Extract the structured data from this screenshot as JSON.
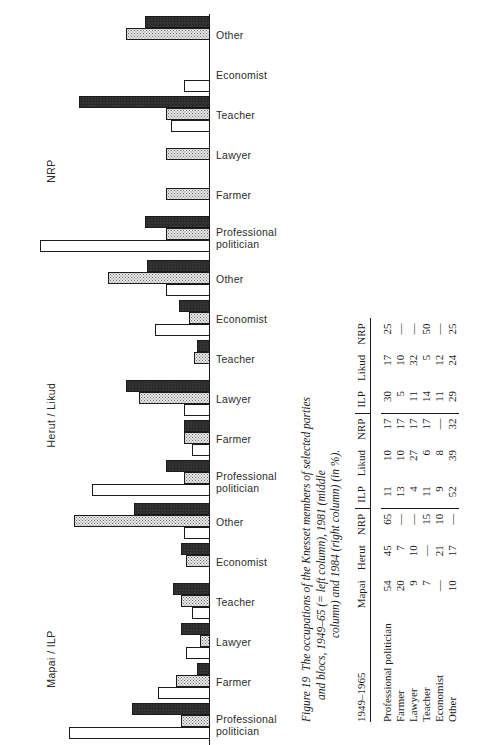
{
  "figure": {
    "number": "Figure 19",
    "caption_line1": "The occupations of the Knesset members of selected parties",
    "caption_line2": "and blocs, 1949–65 (= left column), 1981 (middle",
    "caption_line3": "column) and 1984 (right column) (in %)."
  },
  "chart_data": {
    "type": "bar",
    "orientation": "horizontal-left",
    "title": "The occupations of the Knesset members of selected parties and blocs, 1949–65 (= left column), 1981 (middle column) and 1984 (right column) (in %).",
    "xlabel": "",
    "ylabel": "",
    "xlim": [
      0,
      70
    ],
    "grid": false,
    "legend": [
      "1949–65",
      "1981",
      "1984"
    ],
    "legend_position": "none",
    "categories": [
      "Professional politician",
      "Farmer",
      "Lawyer",
      "Teacher",
      "Economist",
      "Other"
    ],
    "panels": [
      {
        "name": "NRP",
        "label": "NRP",
        "series": [
          {
            "name": "1949–65",
            "style": "white",
            "values": [
              65,
              null,
              null,
              15,
              10,
              null
            ]
          },
          {
            "name": "1981",
            "style": "dot",
            "values": [
              17,
              17,
              17,
              17,
              null,
              32
            ]
          },
          {
            "name": "1984",
            "style": "dark",
            "values": [
              25,
              null,
              null,
              50,
              null,
              25
            ]
          }
        ]
      },
      {
        "name": "Herut / Likud",
        "label": "Herut / Likud",
        "series": [
          {
            "name": "1949–65",
            "style": "white",
            "values": [
              45,
              7,
              10,
              null,
              21,
              17
            ]
          },
          {
            "name": "1981",
            "style": "dot",
            "values": [
              10,
              10,
              27,
              6,
              8,
              39
            ]
          },
          {
            "name": "1984",
            "style": "dark",
            "values": [
              17,
              10,
              32,
              5,
              12,
              24
            ]
          }
        ]
      },
      {
        "name": "Mapai / ILP",
        "label": "Mapai / ILP",
        "series": [
          {
            "name": "1949–65",
            "style": "white",
            "values": [
              54,
              20,
              9,
              7,
              null,
              10
            ]
          },
          {
            "name": "1981",
            "style": "dot",
            "values": [
              11,
              13,
              4,
              11,
              9,
              52
            ]
          },
          {
            "name": "1984",
            "style": "dark",
            "values": [
              30,
              5,
              11,
              14,
              11,
              29
            ]
          }
        ]
      }
    ]
  },
  "table": {
    "group_headers": [
      "",
      "1981",
      "1984"
    ],
    "col_headers": [
      "1949–1965",
      "Mapai",
      "Herut",
      "NRP",
      "ILP",
      "Likud",
      "NRP",
      "ILP",
      "Likud",
      "NRP"
    ],
    "rows": [
      {
        "label": "Professional",
        "label2": "politician",
        "values": [
          "54",
          "45",
          "65",
          "11",
          "10",
          "17",
          "30",
          "17",
          "25"
        ]
      },
      {
        "label": "Farmer",
        "label2": "",
        "values": [
          "20",
          "7",
          "—",
          "13",
          "10",
          "17",
          "5",
          "10",
          "—"
        ]
      },
      {
        "label": "Lawyer",
        "label2": "",
        "values": [
          "9",
          "10",
          "—",
          "4",
          "27",
          "17",
          "11",
          "32",
          "—"
        ]
      },
      {
        "label": "Teacher",
        "label2": "",
        "values": [
          "7",
          "—",
          "15",
          "11",
          "6",
          "17",
          "14",
          "5",
          "50"
        ]
      },
      {
        "label": "Economist",
        "label2": "",
        "values": [
          "—",
          "21",
          "10",
          "9",
          "8",
          "—",
          "11",
          "12",
          "—"
        ]
      },
      {
        "label": "Other",
        "label2": "",
        "values": [
          "10",
          "17",
          "—",
          "52",
          "39",
          "32",
          "29",
          "24",
          "25"
        ]
      }
    ]
  },
  "colors": {
    "ink": "#1a1a1a",
    "fill_white": "#ffffff",
    "fill_dot": "#e9e9e9",
    "fill_dark": "#555555"
  }
}
